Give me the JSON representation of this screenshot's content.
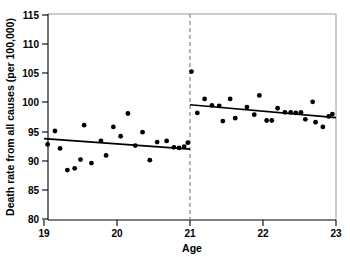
{
  "chart_data": {
    "type": "scatter",
    "title": "",
    "subtitle": "",
    "xlabel": "Age",
    "ylabel": "Death rate from all causes (per 100,000)",
    "xlim": [
      19,
      23
    ],
    "ylim": [
      80,
      115
    ],
    "xticks": [
      19,
      20,
      21,
      22,
      23
    ],
    "xtick_labels": [
      "19",
      "20",
      "21",
      "22",
      "23"
    ],
    "yticks": [
      80,
      85,
      90,
      95,
      100,
      105,
      110,
      115
    ],
    "ytick_labels": [
      "80",
      "85",
      "90",
      "95",
      "100",
      "105",
      "110",
      "115"
    ],
    "grid": false,
    "legend": false,
    "legend_position": "none",
    "annotations": [
      {
        "name": "minimum-legal-drinking-age-cutoff",
        "type": "vertical-dashed-line",
        "x": 21,
        "style": "dashed",
        "color": "#8c8c8c"
      }
    ],
    "series": [
      {
        "name": "Death rate observations",
        "type": "scatter",
        "marker": "filled-circle",
        "color": "#000000",
        "points": [
          {
            "x": 19.05,
            "y": 92.8
          },
          {
            "x": 19.15,
            "y": 95.1
          },
          {
            "x": 19.22,
            "y": 92.1
          },
          {
            "x": 19.32,
            "y": 88.4
          },
          {
            "x": 19.42,
            "y": 88.7
          },
          {
            "x": 19.5,
            "y": 90.2
          },
          {
            "x": 19.55,
            "y": 96.1
          },
          {
            "x": 19.65,
            "y": 89.6
          },
          {
            "x": 19.78,
            "y": 93.4
          },
          {
            "x": 19.85,
            "y": 90.9
          },
          {
            "x": 19.95,
            "y": 95.8
          },
          {
            "x": 20.05,
            "y": 94.2
          },
          {
            "x": 20.15,
            "y": 98.1
          },
          {
            "x": 20.25,
            "y": 92.6
          },
          {
            "x": 20.35,
            "y": 94.9
          },
          {
            "x": 20.45,
            "y": 90.1
          },
          {
            "x": 20.55,
            "y": 93.2
          },
          {
            "x": 20.68,
            "y": 93.4
          },
          {
            "x": 20.78,
            "y": 92.3
          },
          {
            "x": 20.85,
            "y": 92.2
          },
          {
            "x": 20.92,
            "y": 92.4
          },
          {
            "x": 20.97,
            "y": 93.1
          },
          {
            "x": 21.02,
            "y": 105.3
          },
          {
            "x": 21.1,
            "y": 98.2
          },
          {
            "x": 21.2,
            "y": 100.6
          },
          {
            "x": 21.3,
            "y": 99.5
          },
          {
            "x": 21.4,
            "y": 99.4
          },
          {
            "x": 21.45,
            "y": 96.8
          },
          {
            "x": 21.55,
            "y": 100.6
          },
          {
            "x": 21.62,
            "y": 97.3
          },
          {
            "x": 21.78,
            "y": 99.2
          },
          {
            "x": 21.88,
            "y": 97.9
          },
          {
            "x": 21.95,
            "y": 101.2
          },
          {
            "x": 22.05,
            "y": 96.9
          },
          {
            "x": 22.12,
            "y": 96.9
          },
          {
            "x": 22.2,
            "y": 99.0
          },
          {
            "x": 22.3,
            "y": 98.3
          },
          {
            "x": 22.38,
            "y": 98.3
          },
          {
            "x": 22.45,
            "y": 98.2
          },
          {
            "x": 22.52,
            "y": 98.3
          },
          {
            "x": 22.58,
            "y": 97.1
          },
          {
            "x": 22.68,
            "y": 100.1
          },
          {
            "x": 22.72,
            "y": 96.6
          },
          {
            "x": 22.82,
            "y": 95.8
          },
          {
            "x": 22.9,
            "y": 97.6
          },
          {
            "x": 22.95,
            "y": 98.0
          }
        ]
      },
      {
        "name": "Fitted line left of cutoff",
        "type": "line",
        "color": "#000000",
        "x_start": 19.0,
        "x_end": 21.0,
        "y_start": 93.8,
        "y_end": 92.0
      },
      {
        "name": "Fitted line right of cutoff",
        "type": "line",
        "color": "#000000",
        "x_start": 21.0,
        "x_end": 23.0,
        "y_start": 99.6,
        "y_end": 97.4
      }
    ]
  },
  "colors": {
    "marker": "#000000",
    "fit_line": "#000000",
    "cutoff_line": "#8c8c8c",
    "axis": "#000000",
    "frame": "#9a9a9a",
    "background": "#ffffff"
  }
}
